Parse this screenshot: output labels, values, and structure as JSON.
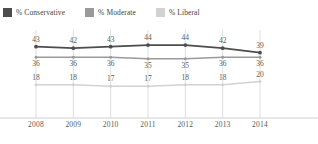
{
  "legend": {
    "items": [
      {
        "label": "% Conservative",
        "color": "#4d4d4d"
      },
      {
        "label": "% Moderate",
        "color": "#9a9a9a"
      },
      {
        "label": "% Liberal",
        "color": "#d2d2d2"
      }
    ]
  },
  "chart_data": {
    "type": "line",
    "title": "",
    "subtitle": "",
    "xlabel": "",
    "ylabel": "",
    "grid": "vertical",
    "legend_position": "top-left",
    "categories": [
      "2008",
      "2009",
      "2010",
      "2011",
      "2012",
      "2013",
      "2014"
    ],
    "ylim": [
      0,
      50
    ],
    "series": [
      {
        "name": "% Conservative",
        "color": "#4d4d4d",
        "values": [
          43,
          42,
          43,
          44,
          44,
          42,
          39
        ],
        "labels": [
          "43",
          "42",
          "43",
          "44",
          "44",
          "42",
          "39"
        ]
      },
      {
        "name": "% Moderate",
        "color": "#9a9a9a",
        "values": [
          36,
          36,
          36,
          35,
          35,
          36,
          36
        ],
        "labels": [
          "36",
          "36",
          "36",
          "35",
          "35",
          "36",
          "36"
        ]
      },
      {
        "name": "% Liberal",
        "color": "#d2d2d2",
        "values": [
          18,
          18,
          17,
          17,
          18,
          18,
          20
        ],
        "labels": [
          "18",
          "18",
          "17",
          "17",
          "18",
          "18",
          "20"
        ]
      }
    ]
  }
}
